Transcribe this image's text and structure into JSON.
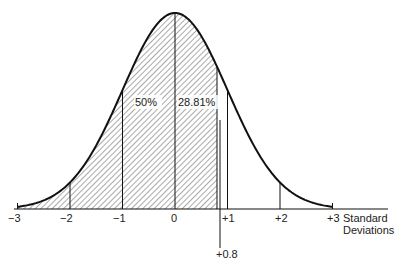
{
  "chart_data": {
    "type": "area",
    "title": "",
    "xlabel": "Standard Deviations",
    "ylabel": "",
    "xlim": [
      -3,
      3
    ],
    "grid": false,
    "legend": null,
    "x_ticks": [
      "−3",
      "−2",
      "−1",
      "0",
      "+1",
      "+2",
      "+3"
    ],
    "x_tick_values": [
      -3,
      -2,
      -1,
      0,
      1,
      2,
      3
    ],
    "shaded_region": {
      "from": -3,
      "to": 0.8,
      "pattern": "diagonal-hatch"
    },
    "marker": {
      "x": 0.8,
      "label": "+0.8"
    },
    "annotations": [
      {
        "text": "50%",
        "region": [
          -1,
          0
        ]
      },
      {
        "text": "28.81%",
        "region": [
          0,
          0.8
        ]
      }
    ],
    "vertical_lines_at": [
      -2,
      -1,
      0,
      0.8,
      1,
      2
    ]
  },
  "labels": {
    "ticks": [
      "−3",
      "−2",
      "−1",
      "0",
      "+1",
      "+2",
      "+3"
    ],
    "axis_line1": "Standard",
    "axis_line2": "Deviations",
    "marker": "+0.8",
    "pct_left": "50%",
    "pct_right": "28.81%"
  }
}
